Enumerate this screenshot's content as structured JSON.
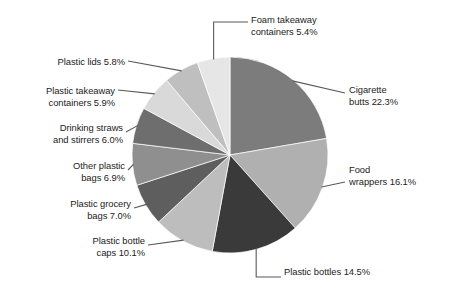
{
  "chart_data": {
    "type": "pie",
    "title": "",
    "subtitle": "",
    "xlabel": "",
    "ylabel": "",
    "legend_position": "callout-labels",
    "grid": false,
    "start_angle_deg": 0,
    "direction": "clockwise",
    "center": {
      "x": 230,
      "y": 155
    },
    "radius": 98,
    "units": "percent",
    "categories": [
      "Cigarette butts",
      "Food wrappers",
      "Plastic bottles",
      "Plastic bottle caps",
      "Plastic grocery bags",
      "Other plastic bags",
      "Drinking straws and stirrers",
      "Plastic takeaway containers",
      "Plastic lids",
      "Foam takeaway containers"
    ],
    "values": [
      22.3,
      16.1,
      14.5,
      10.1,
      7.0,
      6.9,
      6.0,
      5.9,
      5.8,
      5.4
    ],
    "colors": [
      "#7c7c7c",
      "#b0b0b0",
      "#3a3a3a",
      "#bdbdbd",
      "#5e5e5e",
      "#8f8f8f",
      "#6e6e6e",
      "#d9d9d9",
      "#bfbfbf",
      "#e6e6e6"
    ],
    "slices": [
      {
        "id": "cigarette-butts",
        "label": "Cigarette butts 22.3%",
        "label_lines": "Cigarette\nbutts 22.3%",
        "name": "Cigarette butts",
        "value": 22.3,
        "color": "#7c7c7c"
      },
      {
        "id": "food-wrappers",
        "label": "Food wrappers 16.1%",
        "label_lines": "Food\nwrappers 16.1%",
        "name": "Food wrappers",
        "value": 16.1,
        "color": "#b0b0b0"
      },
      {
        "id": "plastic-bottles",
        "label": "Plastic bottles 14.5%",
        "label_lines": "Plastic bottles 14.5%",
        "name": "Plastic bottles",
        "value": 14.5,
        "color": "#3a3a3a"
      },
      {
        "id": "plastic-bottle-caps",
        "label": "Plastic bottle caps 10.1%",
        "label_lines": "Plastic bottle\ncaps 10.1%",
        "name": "Plastic bottle caps",
        "value": 10.1,
        "color": "#bdbdbd"
      },
      {
        "id": "plastic-grocery-bags",
        "label": "Plastic grocery bags 7.0%",
        "label_lines": "Plastic grocery\nbags 7.0%",
        "name": "Plastic grocery bags",
        "value": 7.0,
        "color": "#5e5e5e"
      },
      {
        "id": "other-plastic-bags",
        "label": "Other plastic bags 6.9%",
        "label_lines": "Other plastic\nbags 6.9%",
        "name": "Other plastic bags",
        "value": 6.9,
        "color": "#8f8f8f"
      },
      {
        "id": "drinking-straws-and-stirrers",
        "label": "Drinking straws and stirrers 6.0%",
        "label_lines": "Drinking straws\nand stirrers 6.0%",
        "name": "Drinking straws and stirrers",
        "value": 6.0,
        "color": "#6e6e6e"
      },
      {
        "id": "plastic-takeaway-containers",
        "label": "Plastic takeaway containers 5.9%",
        "label_lines": "Plastic takeaway\ncontainers 5.9%",
        "name": "Plastic takeaway containers",
        "value": 5.9,
        "color": "#d9d9d9"
      },
      {
        "id": "plastic-lids",
        "label": "Plastic lids 5.8%",
        "label_lines": "Plastic lids 5.8%",
        "name": "Plastic lids",
        "value": 5.8,
        "color": "#bfbfbf"
      },
      {
        "id": "foam-takeaway-containers",
        "label": "Foam takeaway containers 5.4%",
        "label_lines": "Foam takeaway\ncontainers 5.4%",
        "name": "Foam takeaway containers",
        "value": 5.4,
        "color": "#e6e6e6"
      }
    ]
  },
  "style": {
    "background": "#ffffff",
    "leader_line_color": "#5a5a5a",
    "text_color": "#1c1c1c"
  }
}
